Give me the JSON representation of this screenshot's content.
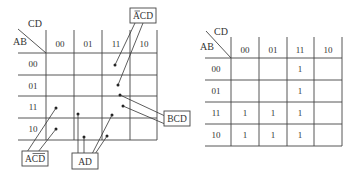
{
  "left_kmap": {
    "row_var": "AB",
    "col_var": "CD",
    "col_headers": [
      "00",
      "01",
      "11",
      "10"
    ],
    "row_headers": [
      "00",
      "01",
      "11",
      "10"
    ],
    "groups": [
      {
        "label": "ĀCD",
        "label_parts": {
          "bar": "A",
          "rest": "CD"
        },
        "cells": [
          [
            "00",
            "11"
          ],
          [
            "01",
            "11"
          ]
        ]
      },
      {
        "label": "BCD",
        "cells": [
          [
            "01",
            "11"
          ],
          [
            "11",
            "11"
          ]
        ]
      },
      {
        "label": "AC̄D",
        "label_parts": {
          "pre": "AC",
          "bar": "D"
        },
        "cells": [
          [
            "11",
            "00"
          ],
          [
            "10",
            "00"
          ]
        ]
      },
      {
        "label": "AD",
        "cells": [
          [
            "11",
            "01"
          ],
          [
            "10",
            "01"
          ],
          [
            "11",
            "11"
          ],
          [
            "10",
            "11"
          ]
        ]
      }
    ],
    "group_labels": {
      "acd_top_pre": "",
      "acd_top_bar": "A",
      "acd_top_rest": "CD",
      "bcd": "BCD",
      "acdbar_pre": "AC",
      "acdbar_bar": "D",
      "ad": "AD"
    }
  },
  "right_kmap": {
    "row_var": "AB",
    "col_var": "CD",
    "col_headers": [
      "00",
      "01",
      "11",
      "10"
    ],
    "row_headers": [
      "00",
      "01",
      "11",
      "10"
    ],
    "cells": [
      [
        "",
        "",
        "1",
        ""
      ],
      [
        "",
        "",
        "1",
        ""
      ],
      [
        "1",
        "1",
        "1",
        ""
      ],
      [
        "1",
        "1",
        "1",
        ""
      ]
    ]
  }
}
